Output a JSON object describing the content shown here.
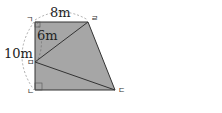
{
  "figure": {
    "type": "trapezoid-geometry",
    "fill_color": "#a6a6a6",
    "stroke_color": "#333333",
    "points": {
      "A": {
        "label": "ㄱ",
        "x": 35,
        "y": 22
      },
      "D": {
        "label": "ㄹ",
        "x": 88,
        "y": 22
      },
      "E": {
        "label": "ㅁ",
        "x": 35,
        "y": 62
      },
      "B": {
        "label": "ㄴ",
        "x": 35,
        "y": 90
      },
      "C": {
        "label": "ㄷ",
        "x": 115,
        "y": 90
      }
    },
    "measurements": {
      "top": "8m",
      "left_total": "10m",
      "upper_segment": "6m"
    }
  }
}
